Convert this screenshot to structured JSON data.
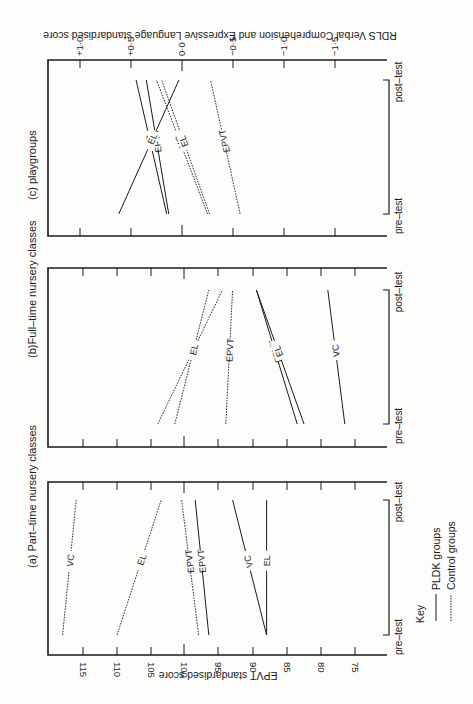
{
  "page": {
    "rotation_note": "Figure printed rotated 90 degrees; time axis runs bottom (pre-test) to top (post-test)."
  },
  "key": {
    "title": "Key",
    "pldk_label": "PLDK groups",
    "control_label": "Control groups"
  },
  "time_labels": {
    "pre": "pre–test",
    "post": "post–test"
  },
  "axes": {
    "epvt_label": "EPVT standardised score",
    "rdls_label": "RDLS  Verbal Comprehension and Expressive Language standardised score",
    "epvt_ticks": [
      "115",
      "110",
      "105",
      "100",
      "95",
      "90",
      "85",
      "80",
      "75"
    ],
    "rdls_ticks": [
      "+1·0",
      "+0·5",
      "0·0",
      "−0·5",
      "−1·0",
      "−1·5"
    ]
  },
  "colors": {
    "ink": "#1a1a1a",
    "paper": "#fdfdfc"
  },
  "chart_data": [
    {
      "type": "line",
      "title": "(a) Part–time nursery classes",
      "x": [
        "pre-test",
        "post-test"
      ],
      "ylabel": "EPVT standardised score",
      "ylim": [
        70,
        120
      ],
      "yticks": [
        115,
        110,
        105,
        100,
        95,
        90,
        85,
        80,
        75
      ],
      "series": [
        {
          "name": "VC",
          "group": "Control",
          "style": "dashed",
          "values": [
            118,
            116
          ]
        },
        {
          "name": "EL",
          "group": "Control",
          "style": "dashed",
          "values": [
            110,
            103.5
          ]
        },
        {
          "name": "EPVT",
          "group": "Control",
          "style": "dashed",
          "values": [
            98,
            100.5
          ]
        },
        {
          "name": "EPVT",
          "group": "PLDK",
          "style": "solid",
          "values": [
            96.5,
            98.5
          ]
        },
        {
          "name": "VC",
          "group": "PLDK",
          "style": "solid",
          "values": [
            88,
            93
          ]
        },
        {
          "name": "EL",
          "group": "PLDK",
          "style": "solid",
          "values": [
            88,
            88
          ]
        }
      ]
    },
    {
      "type": "line",
      "title": "(b)Full–time nursery classes",
      "x": [
        "pre-test",
        "post-test"
      ],
      "ylabel": "EPVT standardised score",
      "ylim": [
        70,
        120
      ],
      "yticks": [
        115,
        110,
        105,
        100,
        95,
        90,
        85,
        80,
        75
      ],
      "series": [
        {
          "name": "VC",
          "group": "Control",
          "style": "dashed",
          "values": [
            104,
            94.5
          ]
        },
        {
          "name": "EL",
          "group": "Control",
          "style": "dashed",
          "values": [
            101.5,
            96.5
          ]
        },
        {
          "name": "EPVT",
          "group": "Control",
          "style": "dashed",
          "values": [
            94,
            93
          ]
        },
        {
          "name": "EPVT",
          "group": "PLDK",
          "style": "solid",
          "values": [
            83.5,
            89.5
          ]
        },
        {
          "name": "EL",
          "group": "PLDK",
          "style": "solid",
          "values": [
            82.5,
            89.5
          ]
        },
        {
          "name": "VC",
          "group": "PLDK",
          "style": "solid",
          "values": [
            76.5,
            79
          ]
        }
      ]
    },
    {
      "type": "line",
      "title": "(c)  playgroups",
      "x": [
        "pre-test",
        "post-test"
      ],
      "ylabel": "RDLS Verbal Comprehension and Expressive Language standardised score (EL, VC); EPVT on same relative position",
      "ylim": [
        -2.0,
        1.3
      ],
      "yticks": [
        1.0,
        0.5,
        0.0,
        -0.5,
        -1.0,
        -1.5
      ],
      "series": [
        {
          "name": "VC",
          "group": "PLDK",
          "style": "solid",
          "values": [
            0.15,
            0.45
          ]
        },
        {
          "name": "EPVT",
          "group": "PLDK",
          "style": "solid",
          "values": [
            0.13,
            0.35
          ]
        },
        {
          "name": "EL",
          "group": "PLDK",
          "style": "solid",
          "values": [
            0.62,
            0.03
          ]
        },
        {
          "name": "VC",
          "group": "Control",
          "style": "dashed",
          "values": [
            -0.25,
            0.25
          ]
        },
        {
          "name": "EL",
          "group": "Control",
          "style": "dashed",
          "values": [
            -0.27,
            0.2
          ]
        },
        {
          "name": "EPVT",
          "group": "Control",
          "style": "dashed",
          "values": [
            -0.57,
            -0.28
          ]
        }
      ]
    }
  ]
}
